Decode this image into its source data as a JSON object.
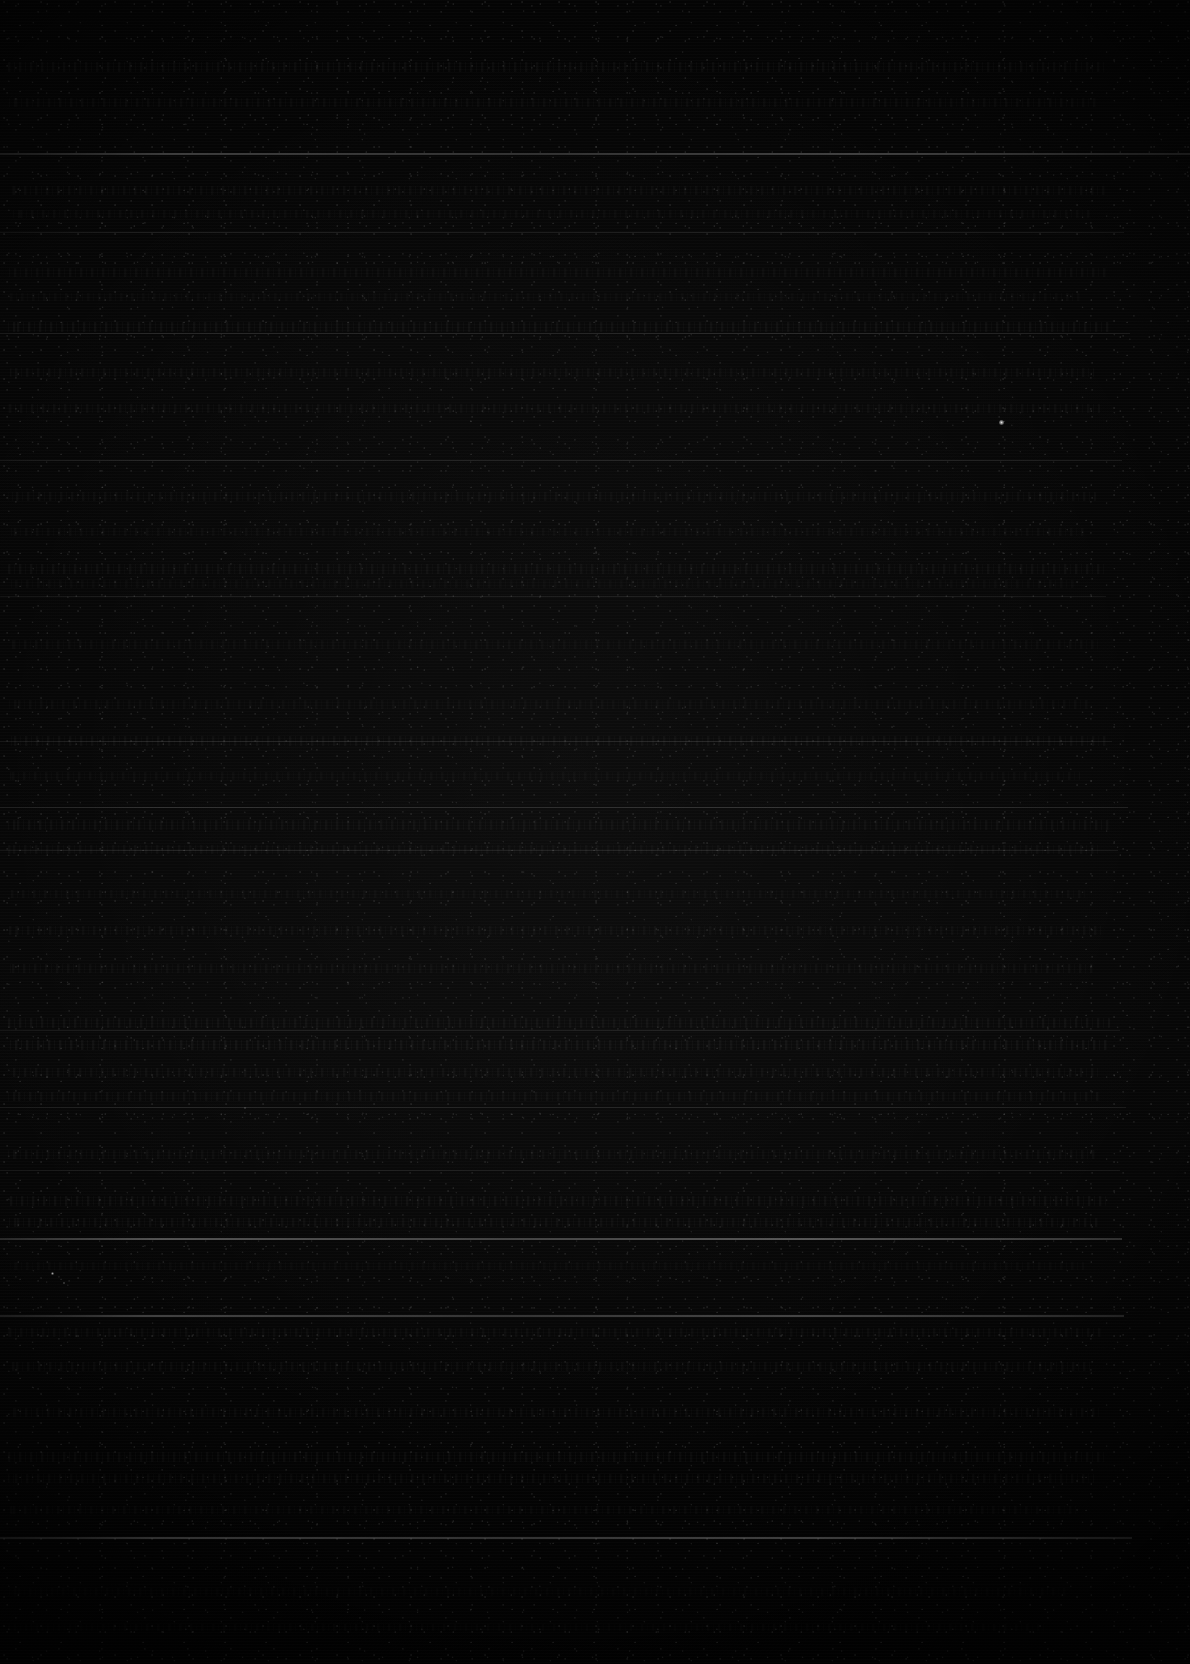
{
  "page": {
    "width": 1190,
    "height": 1664,
    "description": "Near-black underexposed scanned document page; no text is legible",
    "colors": {
      "background": "#000000",
      "paper": "#050505",
      "rule": "#6b6b6b",
      "text_trace": "#2a2a2a",
      "speck": "#ffffff"
    }
  },
  "rules": [
    {
      "y": 153,
      "x": 0,
      "width": 1190,
      "height": 2,
      "opacity": 0.42
    },
    {
      "y": 232,
      "x": 0,
      "width": 1124,
      "height": 1,
      "opacity": 0.2
    },
    {
      "y": 333,
      "x": 0,
      "width": 1130,
      "height": 1,
      "opacity": 0.24
    },
    {
      "y": 460,
      "x": 0,
      "width": 1122,
      "height": 1,
      "opacity": 0.26
    },
    {
      "y": 596,
      "x": 0,
      "width": 1106,
      "height": 1,
      "opacity": 0.18
    },
    {
      "y": 741,
      "x": 0,
      "width": 1112,
      "height": 1,
      "opacity": 0.2
    },
    {
      "y": 807,
      "x": 0,
      "width": 1128,
      "height": 1,
      "opacity": 0.3
    },
    {
      "y": 850,
      "x": 0,
      "width": 1118,
      "height": 1,
      "opacity": 0.22
    },
    {
      "y": 1030,
      "x": 0,
      "width": 1120,
      "height": 1,
      "opacity": 0.2
    },
    {
      "y": 1107,
      "x": 0,
      "width": 1126,
      "height": 1,
      "opacity": 0.22
    },
    {
      "y": 1170,
      "x": 0,
      "width": 1120,
      "height": 1,
      "opacity": 0.18
    },
    {
      "y": 1238,
      "x": 0,
      "width": 1122,
      "height": 2,
      "opacity": 0.58
    },
    {
      "y": 1315,
      "x": 0,
      "width": 1124,
      "height": 2,
      "opacity": 0.46
    },
    {
      "y": 1537,
      "x": 0,
      "width": 1132,
      "height": 2,
      "opacity": 0.5
    }
  ],
  "text_lines": [
    {
      "y": 62,
      "x": 8,
      "width": 1098,
      "height": 10,
      "opacity": 0.13
    },
    {
      "y": 98,
      "x": 8,
      "width": 1090,
      "height": 9,
      "opacity": 0.1
    },
    {
      "y": 186,
      "x": 10,
      "width": 1096,
      "height": 9,
      "opacity": 0.11
    },
    {
      "y": 210,
      "x": 10,
      "width": 1080,
      "height": 8,
      "opacity": 0.09
    },
    {
      "y": 268,
      "x": 8,
      "width": 1100,
      "height": 9,
      "opacity": 0.1
    },
    {
      "y": 293,
      "x": 8,
      "width": 1072,
      "height": 8,
      "opacity": 0.08
    },
    {
      "y": 322,
      "x": 8,
      "width": 1104,
      "height": 10,
      "opacity": 0.14
    },
    {
      "y": 368,
      "x": 10,
      "width": 1084,
      "height": 9,
      "opacity": 0.1
    },
    {
      "y": 404,
      "x": 8,
      "width": 1092,
      "height": 9,
      "opacity": 0.1
    },
    {
      "y": 492,
      "x": 8,
      "width": 1088,
      "height": 9,
      "opacity": 0.1
    },
    {
      "y": 528,
      "x": 10,
      "width": 1076,
      "height": 8,
      "opacity": 0.09
    },
    {
      "y": 564,
      "x": 8,
      "width": 1100,
      "height": 10,
      "opacity": 0.12
    },
    {
      "y": 580,
      "x": 8,
      "width": 1066,
      "height": 8,
      "opacity": 0.08
    },
    {
      "y": 640,
      "x": 10,
      "width": 1090,
      "height": 9,
      "opacity": 0.09
    },
    {
      "y": 700,
      "x": 8,
      "width": 1082,
      "height": 9,
      "opacity": 0.09
    },
    {
      "y": 736,
      "x": 8,
      "width": 1098,
      "height": 10,
      "opacity": 0.12
    },
    {
      "y": 772,
      "x": 10,
      "width": 1070,
      "height": 8,
      "opacity": 0.09
    },
    {
      "y": 820,
      "x": 8,
      "width": 1104,
      "height": 10,
      "opacity": 0.13
    },
    {
      "y": 845,
      "x": 8,
      "width": 1094,
      "height": 9,
      "opacity": 0.11
    },
    {
      "y": 890,
      "x": 10,
      "width": 1078,
      "height": 8,
      "opacity": 0.09
    },
    {
      "y": 926,
      "x": 8,
      "width": 1096,
      "height": 9,
      "opacity": 0.1
    },
    {
      "y": 964,
      "x": 8,
      "width": 1086,
      "height": 9,
      "opacity": 0.11
    },
    {
      "y": 1018,
      "x": 8,
      "width": 1102,
      "height": 10,
      "opacity": 0.15
    },
    {
      "y": 1040,
      "x": 8,
      "width": 1100,
      "height": 10,
      "opacity": 0.16
    },
    {
      "y": 1068,
      "x": 10,
      "width": 1088,
      "height": 9,
      "opacity": 0.12
    },
    {
      "y": 1092,
      "x": 8,
      "width": 1094,
      "height": 9,
      "opacity": 0.12
    },
    {
      "y": 1150,
      "x": 8,
      "width": 1090,
      "height": 9,
      "opacity": 0.11
    },
    {
      "y": 1196,
      "x": 8,
      "width": 1098,
      "height": 10,
      "opacity": 0.14
    },
    {
      "y": 1218,
      "x": 8,
      "width": 1092,
      "height": 9,
      "opacity": 0.13
    },
    {
      "y": 1262,
      "x": 10,
      "width": 1074,
      "height": 8,
      "opacity": 0.08
    },
    {
      "y": 1328,
      "x": 8,
      "width": 1096,
      "height": 9,
      "opacity": 0.11
    },
    {
      "y": 1362,
      "x": 8,
      "width": 1082,
      "height": 9,
      "opacity": 0.1
    },
    {
      "y": 1408,
      "x": 10,
      "width": 1090,
      "height": 9,
      "opacity": 0.11
    },
    {
      "y": 1452,
      "x": 8,
      "width": 1100,
      "height": 10,
      "opacity": 0.13
    },
    {
      "y": 1474,
      "x": 8,
      "width": 1086,
      "height": 9,
      "opacity": 0.11
    },
    {
      "y": 1506,
      "x": 10,
      "width": 1070,
      "height": 8,
      "opacity": 0.09
    },
    {
      "y": 1588,
      "x": 8,
      "width": 1060,
      "height": 8,
      "opacity": 0.06
    },
    {
      "y": 1624,
      "x": 8,
      "width": 1040,
      "height": 7,
      "opacity": 0.05
    }
  ],
  "specks": [
    {
      "x": 1001,
      "y": 422,
      "size": 5,
      "opacity": 0.95
    },
    {
      "x": 52,
      "y": 1273,
      "size": 3,
      "opacity": 0.7
    },
    {
      "x": 64,
      "y": 1283,
      "size": 2,
      "opacity": 0.55
    },
    {
      "x": 245,
      "y": 1108,
      "size": 2,
      "opacity": 0.4
    },
    {
      "x": 595,
      "y": 548,
      "size": 2,
      "opacity": 0.35
    }
  ]
}
